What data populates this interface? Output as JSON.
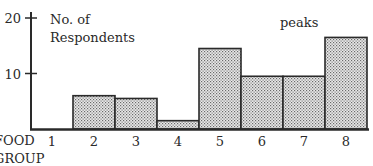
{
  "chart_data": {
    "type": "bar",
    "title": "",
    "ylabel": "No. of Respondents",
    "xlabel": "FOOD GROUP",
    "xlabel_lines": [
      "FOOD",
      "GROUP"
    ],
    "categories": [
      "1",
      "2",
      "3",
      "4",
      "5",
      "6",
      "7",
      "8"
    ],
    "values": [
      0,
      6,
      5.5,
      1.5,
      14.5,
      9.5,
      9.5,
      16.5
    ],
    "yticks": [
      10,
      20
    ],
    "ylim": [
      0,
      20
    ],
    "annotations": [
      {
        "text": "peaks",
        "near": "bars 5-8"
      }
    ],
    "grid": false,
    "legend": null,
    "bar_style": "dotted stipple fill, black outline, adjacent (histogram-style)"
  },
  "colors": {
    "ink": "#2a2a2a",
    "fill_bg": "#e9e9e9",
    "fill_dot": "#6a6a6a",
    "background": "#ffffff"
  }
}
